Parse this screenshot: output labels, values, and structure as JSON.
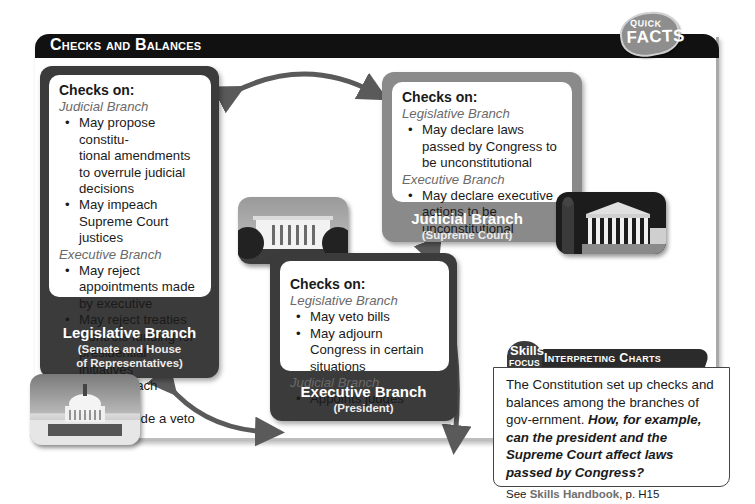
{
  "header": {
    "title": "Checks and Balances",
    "badge_top": "QUICK",
    "badge_bottom": "FACTS"
  },
  "branches": {
    "legislative": {
      "checks_heading": "Checks on:",
      "groups": [
        {
          "target": "Judicial Branch",
          "items": [
            "May propose constitu-\ntional amendments to overrule judicial decisions",
            "May impeach Supreme Court justices"
          ]
        },
        {
          "target": "Executive Branch",
          "items": [
            "May reject appointments made by executive",
            "May reject treaties",
            "Controls funding for presidential initiatives",
            "May impeach president",
            "May override a veto"
          ]
        }
      ],
      "name": "Legislative Branch",
      "subtitle_line1": "(Senate and House",
      "subtitle_line2": "of Representatives)",
      "photo": "capitol-building-photo"
    },
    "judicial": {
      "checks_heading": "Checks on:",
      "groups": [
        {
          "target": "Legislative Branch",
          "items": [
            "May declare laws passed by Congress to be unconstitutional"
          ]
        },
        {
          "target": "Executive Branch",
          "items": [
            "May declare executive actions to be unconstitutional"
          ]
        }
      ],
      "name": "Judicial Branch",
      "subtitle": "(Supreme Court)",
      "photo": "supreme-court-photo"
    },
    "executive": {
      "checks_heading": "Checks on:",
      "groups": [
        {
          "target": "Legislative Branch",
          "items": [
            "May veto bills",
            "May adjourn Congress in certain situations"
          ]
        },
        {
          "target": "Judicial Branch",
          "items": [
            "Appoints judges"
          ]
        }
      ],
      "name": "Executive Branch",
      "subtitle": "(President)",
      "photo": "white-house-photo"
    }
  },
  "skills_focus": {
    "badge_line1": "Skills",
    "badge_line2": "FOCUS",
    "title": "Interpreting Charts",
    "body": "The Constitution set up checks and balances among the branches of gov-ernment.",
    "question": "How, for example, can the president and the Supreme Court affect laws passed by Congress?",
    "see_prefix": "See",
    "see_link": "Skills Handbook",
    "see_suffix": ", p. H15"
  },
  "colors": {
    "dark_box": "#3b3b3b",
    "light_box": "#8a8a8a",
    "arrow": "#5a5a5a",
    "title_bar": "#111111"
  }
}
